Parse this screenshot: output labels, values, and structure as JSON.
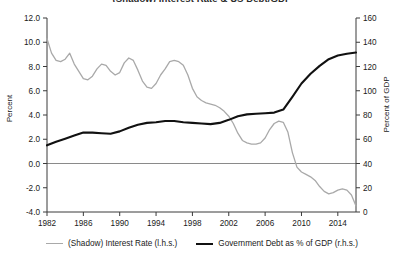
{
  "chart_data": {
    "type": "line",
    "title": "(Shadow) Interest Rate & US Debt/GDP",
    "xlabel": "",
    "ylabel": "Percent",
    "ylabel_right": "Percent of GDP",
    "xlim": [
      1982,
      2016
    ],
    "ylim": [
      -4.0,
      12.0
    ],
    "ylim_right": [
      0,
      160
    ],
    "grid": false,
    "zero_line": true,
    "legend_position": "bottom",
    "colors": {
      "interest_rate": "#a9a9a9",
      "debt_gdp": "#111111",
      "axis": "#3a3a3a",
      "zero_line": "#8a8a8a",
      "background": "#ffffff"
    },
    "x_ticks": [
      1982,
      1986,
      1990,
      1994,
      1998,
      2002,
      2006,
      2010,
      2014
    ],
    "x_tick_labels": [
      "1982",
      "1986",
      "1990",
      "1994",
      "1998",
      "2002",
      "2006",
      "2010",
      "2014"
    ],
    "y_ticks_left": [
      -4.0,
      -2.0,
      0.0,
      2.0,
      4.0,
      6.0,
      8.0,
      10.0,
      12.0
    ],
    "y_tick_labels_left": [
      "-4.0",
      "-2.0",
      "0.0",
      "2.0",
      "4.0",
      "6.0",
      "8.0",
      "10.0",
      "12.0"
    ],
    "y_ticks_right": [
      0,
      20,
      40,
      60,
      80,
      100,
      120,
      140,
      160
    ],
    "y_tick_labels_right": [
      "0",
      "20",
      "40",
      "60",
      "80",
      "100",
      "120",
      "140",
      "160"
    ],
    "series": [
      {
        "name": "(Shadow) Interest Rate (l.h.s.)",
        "axis": "left",
        "color": "#a9a9a9",
        "width": 1.3,
        "x": [
          1982.0,
          1982.5,
          1983.0,
          1983.5,
          1984.0,
          1984.5,
          1985.0,
          1985.5,
          1986.0,
          1986.5,
          1987.0,
          1987.5,
          1988.0,
          1988.5,
          1989.0,
          1989.5,
          1990.0,
          1990.5,
          1991.0,
          1991.5,
          1992.0,
          1992.5,
          1993.0,
          1993.5,
          1994.0,
          1994.5,
          1995.0,
          1995.5,
          1996.0,
          1996.5,
          1997.0,
          1997.5,
          1998.0,
          1998.5,
          1999.0,
          1999.5,
          2000.0,
          2000.5,
          2001.0,
          2001.5,
          2002.0,
          2002.5,
          2003.0,
          2003.5,
          2004.0,
          2004.5,
          2005.0,
          2005.5,
          2006.0,
          2006.5,
          2007.0,
          2007.5,
          2008.0,
          2008.5,
          2009.0,
          2009.5,
          2010.0,
          2010.5,
          2011.0,
          2011.5,
          2012.0,
          2012.5,
          2013.0,
          2013.5,
          2014.0,
          2014.5,
          2015.0,
          2015.5,
          2016.0
        ],
        "y": [
          10.3,
          9.1,
          8.5,
          8.4,
          8.6,
          9.1,
          8.2,
          7.6,
          7.0,
          6.9,
          7.2,
          7.8,
          8.2,
          8.1,
          7.6,
          7.3,
          7.5,
          8.3,
          8.7,
          8.5,
          7.7,
          6.8,
          6.3,
          6.2,
          6.6,
          7.3,
          7.8,
          8.4,
          8.5,
          8.4,
          8.1,
          7.3,
          6.2,
          5.5,
          5.2,
          5.0,
          4.9,
          4.8,
          4.6,
          4.3,
          3.9,
          3.3,
          2.5,
          1.9,
          1.7,
          1.6,
          1.6,
          1.7,
          2.1,
          2.8,
          3.3,
          3.5,
          3.4,
          2.6,
          0.9,
          -0.3,
          -0.7,
          -0.9,
          -1.1,
          -1.4,
          -1.9,
          -2.3,
          -2.5,
          -2.4,
          -2.2,
          -2.1,
          -2.2,
          -2.6,
          -3.5
        ]
      },
      {
        "name": "Government Debt as % of GDP (r.h.s.)",
        "axis": "right",
        "color": "#111111",
        "width": 2.1,
        "x": [
          1982.0,
          1983.0,
          1984.0,
          1985.0,
          1986.0,
          1987.0,
          1988.0,
          1989.0,
          1990.0,
          1991.0,
          1992.0,
          1993.0,
          1994.0,
          1995.0,
          1996.0,
          1997.0,
          1998.0,
          1999.0,
          2000.0,
          2001.0,
          2002.0,
          2003.0,
          2004.0,
          2005.0,
          2006.0,
          2007.0,
          2008.0,
          2009.0,
          2010.0,
          2011.0,
          2012.0,
          2013.0,
          2014.0,
          2015.0,
          2016.0
        ],
        "y": [
          55.0,
          58.0,
          60.5,
          63.0,
          65.5,
          65.5,
          65.0,
          64.5,
          66.5,
          69.5,
          72.0,
          73.5,
          74.0,
          75.0,
          75.0,
          74.0,
          73.5,
          73.0,
          72.5,
          73.5,
          76.0,
          79.0,
          80.5,
          81.0,
          81.5,
          82.0,
          84.5,
          95.0,
          106.0,
          114.0,
          120.5,
          126.0,
          129.0,
          130.5,
          131.5
        ]
      }
    ]
  },
  "legend": {
    "entries": [
      {
        "label": "(Shadow) Interest Rate (l.h.s.)",
        "style": "thin"
      },
      {
        "label": "Government Debt as % of GDP (r.h.s.)",
        "style": "thick"
      }
    ]
  }
}
